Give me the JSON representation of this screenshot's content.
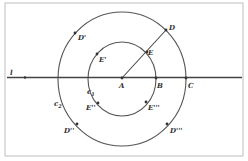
{
  "diagram": {
    "colors": {
      "frame": "#c8c8c8",
      "stroke": "#555555",
      "line": "#444444",
      "point": "#333333",
      "text": "#333333"
    },
    "center": {
      "x": 122,
      "y": 79
    },
    "circles": [
      {
        "name": "c1",
        "label": "c",
        "sub": "1",
        "rx": 34,
        "ry": 37,
        "label_x": 87,
        "label_y": 94
      },
      {
        "name": "c2",
        "label": "c",
        "sub": "2",
        "rx": 64,
        "ry": 67,
        "label_x": 54,
        "label_y": 106
      }
    ],
    "line": {
      "label": "l",
      "y": 77.5,
      "x1": 7,
      "x2": 242,
      "label_x": 10,
      "label_y": 75,
      "dot_x": 25
    },
    "segment": {
      "from": "A",
      "to": "D"
    },
    "points": [
      {
        "id": "A",
        "label": "A",
        "x": 122,
        "y": 78,
        "lx": 119,
        "ly": 88
      },
      {
        "id": "B",
        "label": "B",
        "x": 156,
        "y": 78,
        "lx": 157,
        "ly": 88
      },
      {
        "id": "C",
        "label": "C",
        "x": 186,
        "y": 78,
        "lx": 188,
        "ly": 88
      },
      {
        "id": "D",
        "label": "D",
        "x": 166,
        "y": 30,
        "lx": 169,
        "ly": 30
      },
      {
        "id": "E",
        "label": "E",
        "x": 147,
        "y": 52,
        "lx": 148,
        "ly": 55
      },
      {
        "id": "D1",
        "label": "D'",
        "x": 75,
        "y": 33,
        "lx": 78,
        "ly": 40
      },
      {
        "id": "E1",
        "label": "E'",
        "x": 97,
        "y": 54,
        "lx": 99,
        "ly": 62
      },
      {
        "id": "E2",
        "label": "E''",
        "x": 98,
        "y": 103,
        "lx": 86,
        "ly": 110
      },
      {
        "id": "D2",
        "label": "D''",
        "x": 77,
        "y": 124,
        "lx": 64,
        "ly": 133
      },
      {
        "id": "E3",
        "label": "E'''",
        "x": 146,
        "y": 102,
        "lx": 148,
        "ly": 110
      },
      {
        "id": "D3",
        "label": "D'''",
        "x": 167,
        "y": 124,
        "lx": 170,
        "ly": 133
      }
    ],
    "frame": {
      "x": 5,
      "y": 3,
      "w": 238,
      "h": 153
    }
  }
}
